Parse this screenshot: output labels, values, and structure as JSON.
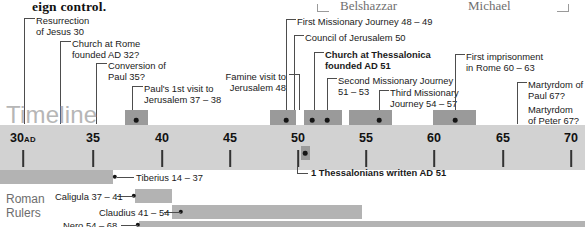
{
  "page_fragments": {
    "body_text_cut": "eign control.",
    "header_names": [
      "Belshazzar",
      "Michael"
    ]
  },
  "timeline": {
    "word": "Timeline",
    "axis": {
      "years": [
        30,
        35,
        40,
        45,
        50,
        55,
        60,
        65,
        70
      ],
      "labels": [
        "30",
        "35",
        "40",
        "45",
        "50",
        "55",
        "60",
        "65",
        "70"
      ],
      "era_suffix": "AD",
      "range": [
        28,
        71
      ]
    },
    "events": [
      {
        "name": "resurrection",
        "label": "Resurrection\nof Jesus 30",
        "line1": "Resurrection",
        "line2": "of Jesus 30",
        "year": 30
      },
      {
        "name": "church-at-rome",
        "line1": "Church at Rome",
        "line2": "founded AD 32?",
        "year": 32
      },
      {
        "name": "conversion-of-paul",
        "line1": "Conversion of",
        "line2": "Paul 35?",
        "year": 35
      },
      {
        "name": "pauls-first-visit",
        "line1": "Paul's 1st visit to",
        "line2": "Jerusalem 37 – 38",
        "year": 37
      },
      {
        "name": "famine-visit",
        "line1": "Famine visit to",
        "line2": "Jerusalem 48",
        "year": 48
      },
      {
        "name": "first-missionary-journey",
        "line1": "First Missionary Journey 48 – 49",
        "line2": "",
        "year": 48
      },
      {
        "name": "council-of-jerusalem",
        "line1": "Council of Jerusalem 50",
        "line2": "",
        "year": 50
      },
      {
        "name": "church-at-thessalonica",
        "line1": "Church at Thessalonica",
        "line2": "founded AD 51",
        "year": 51,
        "bold": true
      },
      {
        "name": "second-missionary-journey",
        "line1": "Second Missionary Journey",
        "line2": "51 – 53",
        "year": 52
      },
      {
        "name": "third-missionary-journey",
        "line1": "Third Missionary",
        "line2": "Journey 54 – 57",
        "year": 55
      },
      {
        "name": "first-imprisonment",
        "line1": "First imprisonment",
        "line2": "in Rome 60 – 63",
        "year": 61
      },
      {
        "name": "martyrdom-of-paul",
        "line1": "Martyrdom of",
        "line2": "Paul 67?",
        "year": 67
      },
      {
        "name": "martyrdom-of-peter",
        "line1": "Martyrdom",
        "line2": "of Peter 67?",
        "year": 67
      }
    ],
    "inline_note": {
      "name": "one-thessalonians-note",
      "text": "1 Thessalonians written AD 51",
      "year": 51
    }
  },
  "roman_rulers": {
    "heading_line1": "Roman",
    "heading_line2": "Rulers",
    "rulers": [
      {
        "name": "tiberius",
        "label": "Tiberius 14 – 37",
        "start": 14,
        "end": 37
      },
      {
        "name": "caligula",
        "label": "Caligula 37 – 41",
        "start": 37,
        "end": 41
      },
      {
        "name": "claudius",
        "label": "Claudius 41 – 54",
        "start": 41,
        "end": 54
      },
      {
        "name": "nero",
        "label": "Nero 54 – 68",
        "start": 54,
        "end": 68
      }
    ]
  },
  "colors": {
    "band": "#d2d2d2",
    "event_bar": "#9a9a9a",
    "ruler_bar": "#b3b3b3",
    "timeline_word": "#b6b6b6",
    "text": "#1a1a1a"
  }
}
